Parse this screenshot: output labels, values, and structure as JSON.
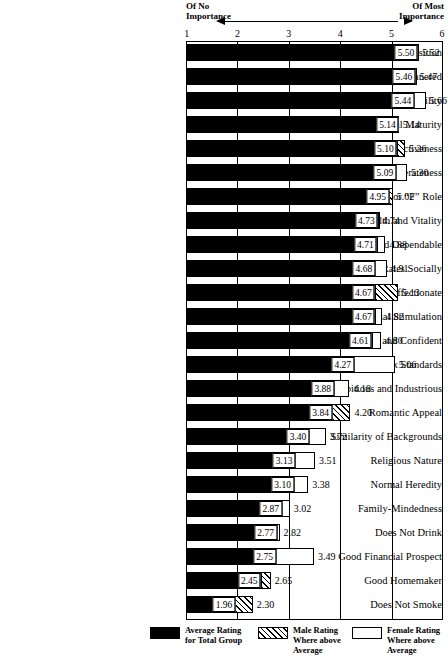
{
  "header": {
    "left_caption": "Of No\nImportance",
    "right_caption": "Of Most\nImportance",
    "arrow_left_icon": "arrow-left-icon",
    "arrow_right_icon": "arrow-right-icon"
  },
  "legend": [
    {
      "key": "total",
      "swatch": "solid-black-swatch",
      "label": "Average Rating\nfor Total Group"
    },
    {
      "key": "male",
      "swatch": "hatched-swatch",
      "label": "Male Rating\nWhere above\nAverage"
    },
    {
      "key": "female",
      "swatch": "white-swatch",
      "label": "Female Rating\nWhere above\nAverage"
    }
  ],
  "chart_data": {
    "type": "bar",
    "orientation": "horizontal",
    "title": "",
    "xlabel": "",
    "ylabel": "",
    "xlim": [
      1,
      6
    ],
    "xticks": [
      1,
      2,
      3,
      4,
      5,
      6
    ],
    "xtick_labels": [
      "1",
      "2",
      "3",
      "4",
      "5",
      "6"
    ],
    "grid": true,
    "legend_position": "bottom",
    "axis_annotations": {
      "left": "Of No Importance",
      "right": "Of Most Importance"
    },
    "series": [
      {
        "name": "Average Rating for Total Group",
        "key": "total",
        "color": "#000000",
        "pattern": "solid"
      },
      {
        "name": "Male Rating Where above Average",
        "key": "male",
        "color": "#000000",
        "pattern": "hatch"
      },
      {
        "name": "Female Rating Where above Average",
        "key": "female",
        "color": "#ffffff",
        "pattern": "open"
      }
    ],
    "categories": [
      "Pleasant Disposition",
      "Well-groomed and Mannered",
      "Sociability",
      "Emotional Maturity",
      "Physical Attractiveness",
      "Considerateness",
      "Traditional “M” or “F” Role",
      "Health and Vitality",
      "Stable and Dependable",
      "Rates Socially",
      "Affectionate",
      "Intellectual Stimulation",
      "Poised and Confident",
      "Conventional Sex Standards",
      "Ambitious and Industrious",
      "Romantic Appeal",
      "Similarity of Backgrounds",
      "Religious Nature",
      "Normal Heredity",
      "Family-Mindedness",
      "Does Not Drink",
      "Good Financial Prospect",
      "Good Homemaker",
      "Does Not Smoke"
    ],
    "rows": [
      {
        "category": "Pleasant Disposition",
        "total": 5.5,
        "end": 5.52,
        "end_group": "male",
        "total_label": "5.50",
        "end_label": "5.52"
      },
      {
        "category": "Well-groomed and Mannered",
        "total": 5.46,
        "end": 5.47,
        "end_group": "male",
        "total_label": "5.46",
        "end_label": "5.47"
      },
      {
        "category": "Sociability",
        "total": 5.44,
        "end": 5.66,
        "end_group": "female",
        "total_label": "5.44",
        "end_label": "5.66"
      },
      {
        "category": "Emotional Maturity",
        "total": 5.14,
        "end": 5.14,
        "end_group": "none",
        "total_label": "5.14",
        "end_label": "5.14"
      },
      {
        "category": "Physical Attractiveness",
        "total": 5.1,
        "end": 5.26,
        "end_group": "male",
        "total_label": "5.10",
        "end_label": "5.26"
      },
      {
        "category": "Considerateness",
        "total": 5.09,
        "end": 5.3,
        "end_group": "female",
        "total_label": "5.09",
        "end_label": "5.30"
      },
      {
        "category": "Traditional “M” or “F” Role",
        "total": 4.95,
        "end": 5.02,
        "end_group": "male",
        "total_label": "4.95",
        "end_label": "5.02"
      },
      {
        "category": "Health and Vitality",
        "total": 4.73,
        "end": 4.74,
        "end_group": "male",
        "total_label": "4.73",
        "end_label": "4.74"
      },
      {
        "category": "Stable and Dependable",
        "total": 4.71,
        "end": 4.88,
        "end_group": "female",
        "total_label": "4.71",
        "end_label": "4.88"
      },
      {
        "category": "Rates Socially",
        "total": 4.68,
        "end": 4.91,
        "end_group": "female",
        "total_label": "4.68",
        "end_label": "4.91"
      },
      {
        "category": "Affectionate",
        "total": 4.67,
        "end": 5.13,
        "end_group": "male",
        "total_label": "4.67",
        "end_label": "5.13"
      },
      {
        "category": "Intellectual Stimulation",
        "total": 4.67,
        "end": 4.82,
        "end_group": "female",
        "total_label": "4.67",
        "end_label": "4.82"
      },
      {
        "category": "Poised and Confident",
        "total": 4.61,
        "end": 4.8,
        "end_group": "female",
        "total_label": "4.61",
        "end_label": "4.80"
      },
      {
        "category": "Conventional Sex Standards",
        "total": 4.27,
        "end": 5.06,
        "end_group": "female",
        "total_label": "4.27",
        "end_label": "5.06"
      },
      {
        "category": "Ambitious and Industrious",
        "total": 3.88,
        "end": 4.18,
        "end_group": "female",
        "total_label": "3.88",
        "end_label": "4.18"
      },
      {
        "category": "Romantic Appeal",
        "total": 3.84,
        "end": 4.2,
        "end_group": "male",
        "total_label": "3.84",
        "end_label": "4.20"
      },
      {
        "category": "Similarity of Backgrounds",
        "total": 3.4,
        "end": 3.72,
        "end_group": "female",
        "total_label": "3.40",
        "end_label": "3.72"
      },
      {
        "category": "Religious Nature",
        "total": 3.13,
        "end": 3.51,
        "end_group": "female",
        "total_label": "3.13",
        "end_label": "3.51"
      },
      {
        "category": "Normal Heredity",
        "total": 3.1,
        "end": 3.38,
        "end_group": "female",
        "total_label": "3.10",
        "end_label": "3.38"
      },
      {
        "category": "Family-Mindedness",
        "total": 2.87,
        "end": 3.02,
        "end_group": "female",
        "total_label": "2.87",
        "end_label": "3.02"
      },
      {
        "category": "Does Not Drink",
        "total": 2.77,
        "end": 2.82,
        "end_group": "female",
        "total_label": "2.77",
        "end_label": "2.82"
      },
      {
        "category": "Good Financial Prospect",
        "total": 2.75,
        "end": 3.49,
        "end_group": "female",
        "total_label": "2.75",
        "end_label": "3.49"
      },
      {
        "category": "Good Homemaker",
        "total": 2.45,
        "end": 2.65,
        "end_group": "male",
        "total_label": "2.45",
        "end_label": "2.65"
      },
      {
        "category": "Does Not Smoke",
        "total": 1.96,
        "end": 2.3,
        "end_group": "male",
        "total_label": "1.96",
        "end_label": "2.30"
      }
    ]
  }
}
